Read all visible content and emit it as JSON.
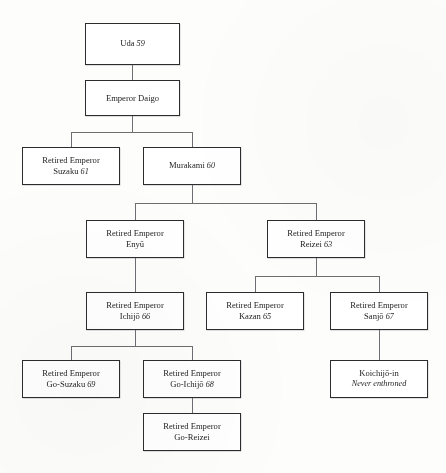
{
  "page": {
    "header_fragment": "",
    "background_color": "#fdfdfc",
    "box_border_color": "#2c2c2e",
    "connector_color": "#6e6e72"
  },
  "chart_data": {
    "type": "diagram",
    "diagram_type": "genealogy-tree",
    "title": "",
    "orientation": "top-down",
    "nodes": [
      {
        "id": "uda",
        "title": "Uda",
        "number": "59",
        "subtitle": "",
        "prefix": "",
        "x": 85,
        "y": 23,
        "w": 95,
        "h": 42,
        "lines": 1
      },
      {
        "id": "daigo",
        "title": "Emperor Daigo",
        "number": "",
        "subtitle": "",
        "prefix": "",
        "x": 85,
        "y": 80,
        "w": 95,
        "h": 36,
        "lines": 1
      },
      {
        "id": "suzaku",
        "title": "Suzaku",
        "number": "61",
        "subtitle": "",
        "prefix": "Retired Emperor",
        "x": 22,
        "y": 147,
        "w": 98,
        "h": 38,
        "lines": 2
      },
      {
        "id": "murakami",
        "title": "Murakami",
        "number": "60",
        "subtitle": "",
        "prefix": "",
        "x": 143,
        "y": 147,
        "w": 98,
        "h": 38,
        "lines": 1
      },
      {
        "id": "enyu",
        "title": "Enyū",
        "number": "",
        "subtitle": "",
        "prefix": "Retired Emperor",
        "x": 86,
        "y": 220,
        "w": 98,
        "h": 38,
        "lines": 2
      },
      {
        "id": "reizei",
        "title": "Reizei",
        "number": "63",
        "subtitle": "",
        "prefix": "Retired Emperor",
        "x": 267,
        "y": 220,
        "w": 98,
        "h": 38,
        "lines": 2
      },
      {
        "id": "ichijo",
        "title": "Ichijō",
        "number": "66",
        "subtitle": "",
        "prefix": "Retired Emperor",
        "x": 86,
        "y": 292,
        "w": 98,
        "h": 38,
        "lines": 2
      },
      {
        "id": "kazan",
        "title": "Kazan",
        "number": "65",
        "subtitle": "",
        "prefix": "Retired Emperor",
        "x": 206,
        "y": 292,
        "w": 98,
        "h": 38,
        "lines": 2
      },
      {
        "id": "sanjo",
        "title": "Sanjō",
        "number": "67",
        "subtitle": "",
        "prefix": "Retired Emperor",
        "x": 330,
        "y": 292,
        "w": 98,
        "h": 38,
        "lines": 2
      },
      {
        "id": "go-suzaku",
        "title": "Go-Suzaku",
        "number": "69",
        "subtitle": "",
        "prefix": "Retired Emperor",
        "x": 22,
        "y": 360,
        "w": 98,
        "h": 38,
        "lines": 2
      },
      {
        "id": "go-ichijo",
        "title": "Go-Ichijō",
        "number": "68",
        "subtitle": "",
        "prefix": "Retired Emperor",
        "x": 143,
        "y": 360,
        "w": 98,
        "h": 38,
        "lines": 2
      },
      {
        "id": "koichijo-in",
        "title": "Koichijō-in",
        "number": "",
        "subtitle": "Never enthroned",
        "prefix": "",
        "x": 330,
        "y": 360,
        "w": 98,
        "h": 38,
        "lines": 2
      },
      {
        "id": "go-reizei",
        "title": "Go-Reizei",
        "number": "",
        "subtitle": "",
        "prefix": "Retired Emperor",
        "x": 143,
        "y": 413,
        "w": 98,
        "h": 38,
        "lines": 2
      }
    ],
    "edges": [
      {
        "from": "uda",
        "to": "daigo"
      },
      {
        "from": "daigo",
        "to": "suzaku"
      },
      {
        "from": "daigo",
        "to": "murakami"
      },
      {
        "from": "murakami",
        "to": "enyu"
      },
      {
        "from": "murakami",
        "to": "reizei"
      },
      {
        "from": "enyu",
        "to": "ichijo"
      },
      {
        "from": "reizei",
        "to": "kazan"
      },
      {
        "from": "reizei",
        "to": "sanjo"
      },
      {
        "from": "ichijo",
        "to": "go-suzaku"
      },
      {
        "from": "ichijo",
        "to": "go-ichijo"
      },
      {
        "from": "sanjo",
        "to": "koichijo-in"
      },
      {
        "from": "go-ichijo",
        "to": "go-reizei"
      }
    ]
  }
}
